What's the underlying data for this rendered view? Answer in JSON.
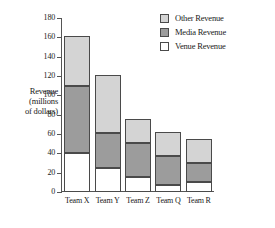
{
  "chart_data": {
    "type": "bar",
    "subtype": "stacked-bar",
    "title": "",
    "xlabel": "",
    "ylabel": "Revenue (millions of dollars)",
    "ylabel_lines": [
      "Revenue",
      "(millions",
      "of dollars)"
    ],
    "categories": [
      "Team X",
      "Team Y",
      "Team Z",
      "Team Q",
      "Team R"
    ],
    "ylim": [
      0,
      180
    ],
    "yticks": [
      0,
      20,
      40,
      60,
      80,
      100,
      120,
      140,
      160,
      180
    ],
    "grid": false,
    "legend_position": "top-right",
    "series": [
      {
        "name": "Venue Revenue",
        "color": "#ffffff",
        "values": [
          40,
          25,
          16,
          7,
          10
        ]
      },
      {
        "name": "Media Revenue",
        "color": "#9c9c9c",
        "values": [
          70,
          36,
          35,
          30,
          20
        ]
      },
      {
        "name": "Other Revenue",
        "color": "#d4d4d4",
        "values": [
          51,
          60,
          25,
          25,
          25
        ]
      }
    ],
    "stack_order_bottom_to_top": [
      "Venue Revenue",
      "Media Revenue",
      "Other Revenue"
    ],
    "totals": [
      161,
      121,
      76,
      62,
      55
    ],
    "segment_boundaries": {
      "Team X": [
        0,
        40,
        110,
        161
      ],
      "Team Y": [
        0,
        25,
        61,
        121
      ],
      "Team Z": [
        0,
        16,
        51,
        76
      ],
      "Team Q": [
        0,
        7,
        37,
        62
      ],
      "Team R": [
        0,
        10,
        30,
        55
      ]
    }
  },
  "legend": {
    "entries": [
      {
        "label": "Other Revenue",
        "color": "#d4d4d4"
      },
      {
        "label": "Media Revenue",
        "color": "#9c9c9c"
      },
      {
        "label": "Venue Revenue",
        "color": "#ffffff"
      }
    ]
  }
}
